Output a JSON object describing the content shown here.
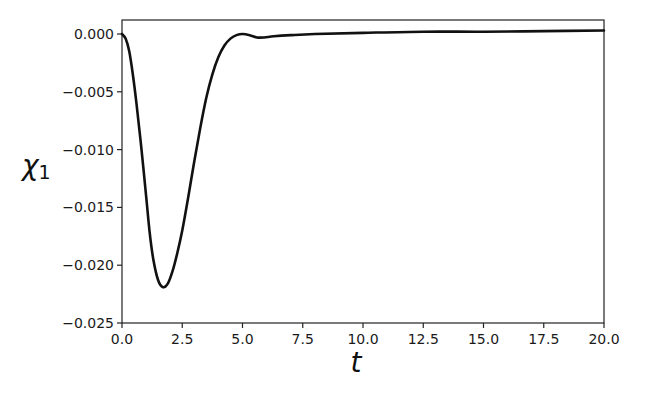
{
  "chart_data": {
    "type": "line",
    "title": "",
    "xlabel": "t",
    "ylabel": "χ",
    "ylabel_subscript": "1",
    "xlim": [
      0,
      20
    ],
    "ylim": [
      -0.025,
      0.001
    ],
    "grid": false,
    "legend": "none",
    "x_ticks": [
      0.0,
      2.5,
      5.0,
      7.5,
      10.0,
      12.5,
      15.0,
      17.5,
      20.0
    ],
    "x_tick_labels": [
      "0.0",
      "2.5",
      "5.0",
      "7.5",
      "10.0",
      "12.5",
      "15.0",
      "17.5",
      "20.0"
    ],
    "y_ticks": [
      0.0,
      -0.005,
      -0.01,
      -0.015,
      -0.02,
      -0.025
    ],
    "y_tick_labels": [
      "0.000",
      "−0.005",
      "−0.010",
      "−0.015",
      "−0.020",
      "−0.025"
    ],
    "series": [
      {
        "name": "chi_1",
        "color": "#111111",
        "x": [
          0,
          0.15,
          0.3,
          0.45,
          0.6,
          0.8,
          1.0,
          1.15,
          1.3,
          1.5,
          1.7,
          1.9,
          2.1,
          2.3,
          2.5,
          2.75,
          3.0,
          3.25,
          3.5,
          3.75,
          4.0,
          4.25,
          4.5,
          4.75,
          5.0,
          5.3,
          5.6,
          5.9,
          6.3,
          7.0,
          8.0,
          10.0,
          12.5,
          15.0,
          17.5,
          20.0
        ],
        "y": [
          0.0,
          -0.0004,
          -0.0015,
          -0.0035,
          -0.006,
          -0.0098,
          -0.014,
          -0.0172,
          -0.0195,
          -0.0213,
          -0.0219,
          -0.0216,
          -0.0205,
          -0.0189,
          -0.017,
          -0.0141,
          -0.011,
          -0.0081,
          -0.0055,
          -0.0035,
          -0.002,
          -0.001,
          -0.0004,
          -0.0001,
          0.0,
          -0.0001,
          -0.0003,
          -0.0003,
          -0.0002,
          -0.0001,
          0.0,
          0.0001,
          0.0002,
          0.0002,
          0.00025,
          0.0003
        ]
      }
    ]
  }
}
